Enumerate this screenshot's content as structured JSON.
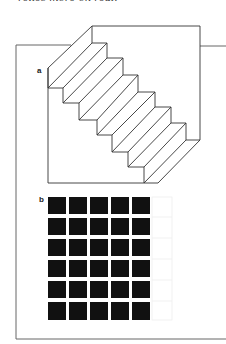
{
  "page": {
    "caption_fragment": "relies more on real."
  },
  "figure": {
    "panels": [
      {
        "label": "a",
        "description": "Schröder staircase ambiguous figure",
        "steps": 6
      },
      {
        "label": "b",
        "description": "Hermann grid illusion",
        "rows": 6,
        "columns": 5,
        "square_color": "#111111",
        "background_color": "#ffffff"
      }
    ],
    "frame_color": "#555555",
    "line_color": "#333333"
  }
}
